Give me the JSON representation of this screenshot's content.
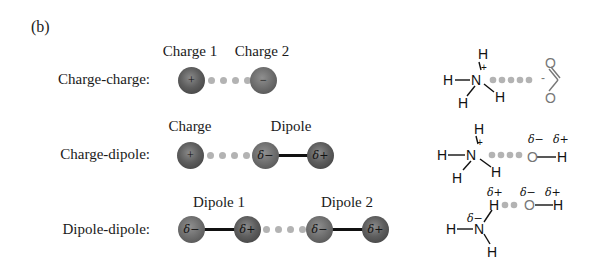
{
  "figure": {
    "panel_label": "(b)",
    "rows": [
      {
        "label": "Charge-charge:",
        "top_labels": [
          "Charge 1",
          "Charge 2"
        ],
        "spheres": [
          "+",
          "−"
        ],
        "example": {
          "molecule_left": {
            "atoms": [
              "H",
              "H",
              "N",
              "H",
              "H"
            ],
            "charge": "+"
          },
          "molecule_right": {
            "atoms": [
              "O",
              "O"
            ],
            "charge": "-"
          }
        }
      },
      {
        "label": "Charge-dipole:",
        "top_labels": [
          "Charge",
          "Dipole"
        ],
        "spheres": [
          "+",
          "δ−",
          "δ+"
        ],
        "example": {
          "molecule_left": {
            "atoms": [
              "H",
              "H",
              "N",
              "H",
              "H"
            ],
            "charge": "+"
          },
          "molecule_right": {
            "atoms": [
              "O",
              "H"
            ],
            "partial_charges": [
              "δ−",
              "δ+"
            ]
          }
        }
      },
      {
        "label": "Dipole-dipole:",
        "top_labels": [
          "Dipole 1",
          "Dipole 2"
        ],
        "spheres": [
          "δ−",
          "δ+",
          "δ−",
          "δ+"
        ],
        "example": {
          "molecule_left": {
            "atoms": [
              "H",
              "H",
              "N",
              "H"
            ],
            "partial_charges": [
              "δ+",
              "δ−"
            ]
          },
          "molecule_right": {
            "atoms": [
              "O",
              "H"
            ],
            "partial_charges": [
              "δ−",
              "δ+"
            ]
          }
        }
      }
    ],
    "colors": {
      "sphere": "#5e5e5e",
      "dots": "#b3b3b3",
      "bond": "#111111",
      "text": "#1a1a1a"
    }
  },
  "chem": {
    "H": "H",
    "N": "N",
    "O": "O",
    "plus": "+",
    "minus": "-",
    "dminus": "δ−",
    "dplus": "δ+"
  }
}
